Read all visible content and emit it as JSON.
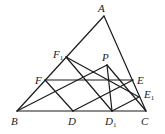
{
  "diagram": {
    "type": "geometry",
    "points": {
      "A": {
        "x": 104,
        "y": 16,
        "label": "A",
        "sub": "",
        "lx": 98,
        "ly": 12
      },
      "B": {
        "x": 17,
        "y": 111,
        "label": "B",
        "sub": "",
        "lx": 11,
        "ly": 125
      },
      "C": {
        "x": 146,
        "y": 111,
        "label": "C",
        "sub": "",
        "lx": 141,
        "ly": 125
      },
      "D": {
        "x": 73,
        "y": 111,
        "label": "D",
        "sub": "",
        "lx": 68,
        "ly": 125
      },
      "D1": {
        "x": 112,
        "y": 111,
        "label": "D",
        "sub": "1",
        "lx": 105,
        "ly": 125
      },
      "E": {
        "x": 133,
        "y": 80,
        "label": "E",
        "sub": "",
        "lx": 137,
        "ly": 84
      },
      "E1": {
        "x": 139,
        "y": 97,
        "label": "E",
        "sub": "1",
        "lx": 144,
        "ly": 98
      },
      "F": {
        "x": 45,
        "y": 80,
        "label": "F",
        "sub": "",
        "lx": 35,
        "ly": 84
      },
      "F1": {
        "x": 66,
        "y": 57,
        "label": "F",
        "sub": "1",
        "lx": 53,
        "ly": 58
      },
      "P": {
        "x": 107,
        "y": 65,
        "label": "P",
        "sub": "",
        "lx": 102,
        "ly": 61
      }
    },
    "segments": [
      [
        "A",
        "B"
      ],
      [
        "A",
        "C"
      ],
      [
        "B",
        "C"
      ],
      [
        "F",
        "E"
      ],
      [
        "F",
        "D"
      ],
      [
        "D",
        "E"
      ],
      [
        "F1",
        "D1"
      ],
      [
        "F1",
        "E1"
      ],
      [
        "D1",
        "E1"
      ],
      [
        "B",
        "P"
      ],
      [
        "P",
        "D1"
      ],
      [
        "P",
        "C"
      ]
    ]
  }
}
